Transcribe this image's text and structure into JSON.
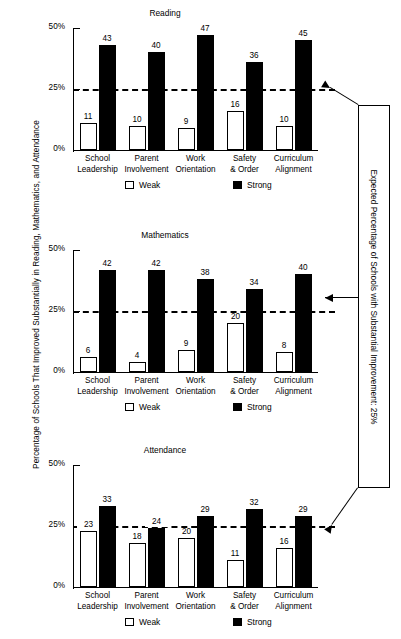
{
  "axis": {
    "y_label": "Percentage of Schools That Improved Substantially in Reading, Mathematics, and Attendance",
    "ticks": [
      "50%",
      "25%",
      "0%"
    ]
  },
  "legend": {
    "weak": "Weak",
    "strong": "Strong"
  },
  "callout": {
    "text": "Expected Percentage of Schools with Substantial Improvement: 25%"
  },
  "categories": [
    {
      "l1": "School",
      "l2": "Leadership"
    },
    {
      "l1": "Parent",
      "l2": "Involvement"
    },
    {
      "l1": "Work",
      "l2": "Orientation"
    },
    {
      "l1": "Safety",
      "l2": "& Order"
    },
    {
      "l1": "Curriculum",
      "l2": "Alignment"
    }
  ],
  "panels": [
    {
      "title": "Reading",
      "weak": [
        11,
        10,
        9,
        16,
        10
      ],
      "strong": [
        43,
        40,
        47,
        36,
        45
      ]
    },
    {
      "title": "Mathematics",
      "weak": [
        6,
        4,
        9,
        20,
        8
      ],
      "strong": [
        42,
        42,
        38,
        34,
        40
      ]
    },
    {
      "title": "Attendance",
      "weak": [
        23,
        18,
        20,
        11,
        16
      ],
      "strong": [
        33,
        24,
        29,
        32,
        29
      ]
    }
  ],
  "chart_data": {
    "type": "bar",
    "title": "Percentage of Schools That Improved Substantially in Reading, Mathematics, and Attendance",
    "xlabel": "",
    "ylabel": "Percentage of Schools That Improved Substantially in Reading, Mathematics, and Attendance",
    "ylim": [
      0,
      50
    ],
    "yticks": [
      0,
      25,
      50
    ],
    "ytick_labels": [
      "0%",
      "25%",
      "50%"
    ],
    "grid": false,
    "legend": [
      "Weak",
      "Strong"
    ],
    "legend_position": "bottom",
    "categories": [
      "School Leadership",
      "Parent Involvement",
      "Work Orientation",
      "Safety & Order",
      "Curriculum Alignment"
    ],
    "annotations": [
      {
        "type": "reference_line",
        "value": 25,
        "style": "dashed",
        "label": "Expected Percentage of Schools with Substantial Improvement: 25%"
      }
    ],
    "panels": [
      {
        "title": "Reading",
        "series": [
          {
            "name": "Weak",
            "values": [
              11,
              10,
              9,
              16,
              10
            ]
          },
          {
            "name": "Strong",
            "values": [
              43,
              40,
              47,
              36,
              45
            ]
          }
        ]
      },
      {
        "title": "Mathematics",
        "series": [
          {
            "name": "Weak",
            "values": [
              6,
              4,
              9,
              20,
              8
            ]
          },
          {
            "name": "Strong",
            "values": [
              42,
              42,
              38,
              34,
              40
            ]
          }
        ]
      },
      {
        "title": "Attendance",
        "series": [
          {
            "name": "Weak",
            "values": [
              23,
              18,
              20,
              11,
              16
            ]
          },
          {
            "name": "Strong",
            "values": [
              33,
              24,
              29,
              32,
              29
            ]
          }
        ]
      }
    ]
  }
}
